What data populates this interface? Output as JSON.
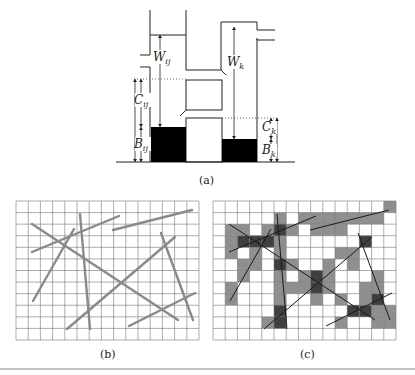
{
  "figure": {
    "panel_a": {
      "caption": "(a)",
      "labels": {
        "W_ij": {
          "main": "W",
          "sub": "ij"
        },
        "W_k": {
          "main": "W",
          "sub": "k"
        },
        "C_ij": {
          "main": "C",
          "sub": "ij"
        },
        "B_ij": {
          "main": "B",
          "sub": "ij"
        },
        "C_k": {
          "main": "C",
          "sub": "k"
        },
        "B_k": {
          "main": "B",
          "sub": "k"
        }
      }
    },
    "panel_b": {
      "caption": "(b)",
      "grid": {
        "cols": 15,
        "rows": 12
      },
      "line_color": "#8a8a8a"
    },
    "panel_c": {
      "caption": "(c)",
      "grid": {
        "cols": 15,
        "rows": 12
      },
      "shade_light": "#8f8f8f",
      "shade_dark": "#3f3f3f",
      "line_color": "#1a1a1a"
    },
    "lines": [
      {
        "id": "A",
        "x1": 32,
        "y1": 252,
        "x2": 119,
        "y2": 216
      },
      {
        "id": "B",
        "x1": 113,
        "y1": 230,
        "x2": 192,
        "y2": 210
      },
      {
        "id": "C",
        "x1": 32,
        "y1": 224,
        "x2": 178,
        "y2": 320
      },
      {
        "id": "D",
        "x1": 33,
        "y1": 301,
        "x2": 74,
        "y2": 229
      },
      {
        "id": "E",
        "x1": 80,
        "y1": 214,
        "x2": 90,
        "y2": 329
      },
      {
        "id": "F",
        "x1": 67,
        "y1": 329,
        "x2": 175,
        "y2": 237
      },
      {
        "id": "G",
        "x1": 161,
        "y1": 233,
        "x2": 193,
        "y2": 320
      },
      {
        "id": "H",
        "x1": 129,
        "y1": 326,
        "x2": 195,
        "y2": 293
      }
    ],
    "shaded_cells_light": [
      [
        14,
        0
      ],
      [
        5,
        1
      ],
      [
        7,
        1
      ],
      [
        8,
        1
      ],
      [
        9,
        1
      ],
      [
        10,
        1
      ],
      [
        11,
        1
      ],
      [
        12,
        1
      ],
      [
        13,
        1
      ],
      [
        1,
        2
      ],
      [
        2,
        2
      ],
      [
        4,
        2
      ],
      [
        5,
        2
      ],
      [
        6,
        2
      ],
      [
        8,
        2
      ],
      [
        9,
        2
      ],
      [
        10,
        2
      ],
      [
        1,
        3
      ],
      [
        3,
        3
      ],
      [
        5,
        3
      ],
      [
        12,
        3
      ],
      [
        1,
        4
      ],
      [
        3,
        4
      ],
      [
        5,
        4
      ],
      [
        10,
        4
      ],
      [
        11,
        4
      ],
      [
        2,
        5
      ],
      [
        3,
        5
      ],
      [
        5,
        5
      ],
      [
        6,
        5
      ],
      [
        9,
        5
      ],
      [
        11,
        5
      ],
      [
        2,
        6
      ],
      [
        5,
        6
      ],
      [
        7,
        6
      ],
      [
        8,
        6
      ],
      [
        9,
        6
      ],
      [
        13,
        6
      ],
      [
        1,
        7
      ],
      [
        5,
        7
      ],
      [
        6,
        7
      ],
      [
        7,
        7
      ],
      [
        9,
        7
      ],
      [
        12,
        7
      ],
      [
        13,
        7
      ],
      [
        1,
        8
      ],
      [
        5,
        8
      ],
      [
        8,
        8
      ],
      [
        10,
        8
      ],
      [
        12,
        8
      ],
      [
        5,
        9
      ],
      [
        11,
        9
      ],
      [
        14,
        9
      ],
      [
        4,
        10
      ],
      [
        5,
        10
      ],
      [
        10,
        10
      ],
      [
        13,
        10
      ],
      [
        14,
        10
      ],
      [
        13,
        9
      ]
    ],
    "shaded_cells_dark": [
      [
        5,
        2
      ],
      [
        2,
        3
      ],
      [
        3,
        3
      ],
      [
        4,
        3
      ],
      [
        5,
        5
      ],
      [
        12,
        3
      ],
      [
        8,
        6
      ],
      [
        8,
        7
      ],
      [
        13,
        8
      ],
      [
        11,
        9
      ],
      [
        12,
        9
      ],
      [
        5,
        9
      ],
      [
        5,
        10
      ]
    ]
  }
}
